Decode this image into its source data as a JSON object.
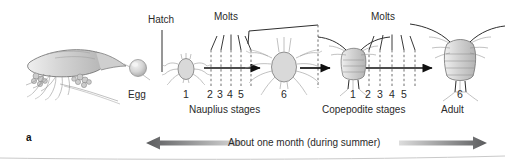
{
  "figure": {
    "panel_letter": "a",
    "title_timeline": "About one month (during summer)"
  },
  "labels": {
    "hatch": "Hatch",
    "molts_1": "Molts",
    "molts_2": "Molts",
    "egg": "Egg",
    "nauplius_stages": "Nauplius stages",
    "copepodite_stages": "Copepodite stages",
    "adult": "Adult"
  },
  "stages": {
    "nauplius": {
      "first": "1",
      "intermediate": [
        "2",
        "3",
        "4",
        "5"
      ],
      "last": "6"
    },
    "copepodite": {
      "first": "1",
      "intermediate": [
        "2",
        "3",
        "4",
        "5"
      ],
      "last": "6"
    }
  },
  "organisms": {
    "adult_female_with_eggsacs": "adult-copepod-with-egg-sacs",
    "egg": "egg-sphere",
    "nauplius_1": "nauplius-larva-stage-1",
    "nauplius_6": "nauplius-larva-stage-6",
    "copepodite_1": "copepodite-stage-1",
    "adult_6": "adult-copepod-stage-6"
  },
  "colors": {
    "ink": "#231f20",
    "organism_fill": "#d9d9d9",
    "organism_stroke": "#6a6a6a",
    "dashed_line": "#6f6f6f",
    "arrow": "#111111",
    "timeline_arrow_dark": "#58595b",
    "timeline_arrow_light": "#d8d8d8"
  }
}
